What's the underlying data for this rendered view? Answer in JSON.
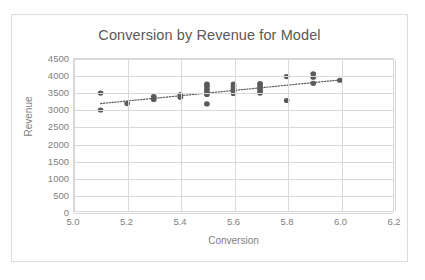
{
  "chart_data": {
    "type": "scatter",
    "title": "Conversion by Revenue for Model",
    "xlabel": "Conversion",
    "ylabel": "Revenue",
    "xlim": [
      5.0,
      6.2
    ],
    "ylim": [
      0,
      4500
    ],
    "xticks": [
      "5.0",
      "5.2",
      "5.4",
      "5.6",
      "5.8",
      "6.0",
      "6.2"
    ],
    "xtick_values": [
      5.0,
      5.2,
      5.4,
      5.6,
      5.8,
      6.0,
      6.2
    ],
    "yticks": [
      "0",
      "500",
      "1000",
      "1500",
      "2000",
      "2500",
      "3000",
      "3500",
      "4000",
      "4500"
    ],
    "ytick_values": [
      0,
      500,
      1000,
      1500,
      2000,
      2500,
      3000,
      3500,
      4000,
      4500
    ],
    "grid": true,
    "legend": false,
    "marker_color": "#5a5a5a",
    "trendline_color": "#595959",
    "trendline_style": "dotted",
    "points": [
      {
        "x": 5.1,
        "y": 3490
      },
      {
        "x": 5.1,
        "y": 2990
      },
      {
        "x": 5.2,
        "y": 3180
      },
      {
        "x": 5.3,
        "y": 3390
      },
      {
        "x": 5.3,
        "y": 3300
      },
      {
        "x": 5.4,
        "y": 3450
      },
      {
        "x": 5.4,
        "y": 3370
      },
      {
        "x": 5.5,
        "y": 3760
      },
      {
        "x": 5.5,
        "y": 3690
      },
      {
        "x": 5.5,
        "y": 3600
      },
      {
        "x": 5.5,
        "y": 3520
      },
      {
        "x": 5.5,
        "y": 3450
      },
      {
        "x": 5.5,
        "y": 3170
      },
      {
        "x": 5.6,
        "y": 3760
      },
      {
        "x": 5.6,
        "y": 3690
      },
      {
        "x": 5.6,
        "y": 3620
      },
      {
        "x": 5.6,
        "y": 3550
      },
      {
        "x": 5.6,
        "y": 3480
      },
      {
        "x": 5.7,
        "y": 3770
      },
      {
        "x": 5.7,
        "y": 3700
      },
      {
        "x": 5.7,
        "y": 3630
      },
      {
        "x": 5.7,
        "y": 3560
      },
      {
        "x": 5.7,
        "y": 3490
      },
      {
        "x": 5.8,
        "y": 3980
      },
      {
        "x": 5.8,
        "y": 3270
      },
      {
        "x": 5.9,
        "y": 4060
      },
      {
        "x": 5.9,
        "y": 3960
      },
      {
        "x": 5.9,
        "y": 3780
      },
      {
        "x": 6.0,
        "y": 3870
      }
    ],
    "trendline": [
      {
        "x": 5.1,
        "y": 3180
      },
      {
        "x": 6.0,
        "y": 3880
      }
    ]
  }
}
